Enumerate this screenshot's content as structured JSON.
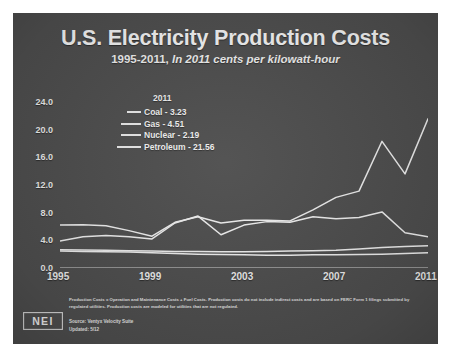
{
  "slide": {
    "background_color": "#4e4e4e",
    "title": "U.S. Electricity Production Costs",
    "subtitle_plain": "1995-2011,",
    "subtitle_italic": "In 2011 cents per kilowatt-hour"
  },
  "legend": {
    "header": "2011",
    "items": [
      {
        "label": "Coal - 3.23",
        "swatch_width": 14,
        "color": "#e8e8e8"
      },
      {
        "label": "Gas - 4.51",
        "swatch_width": 20,
        "color": "#e8e8e8"
      },
      {
        "label": "Nuclear - 2.19",
        "swatch_width": 20,
        "color": "#e8e8e8"
      },
      {
        "label": "Petroleum - 21.56",
        "swatch_width": 24,
        "color": "#e8e8e8"
      }
    ]
  },
  "footnote": "Production Costs = Operation and Maintenance Costs + Fuel Costs. Production costs do not include indirect costs and are based on FERC Form 1 filings submitted by regulated utilities. Production costs are modeled for utilities that are not regulated.",
  "source_line": "Source: Ventyx Velocity Suite",
  "updated_line": "Updated: 5/12",
  "logo": {
    "text": "NEI"
  },
  "chart_data": {
    "type": "line",
    "title": "U.S. Electricity Production Costs",
    "subtitle": "1995-2011, In 2011 cents per kilowatt-hour",
    "xlabel": "",
    "ylabel": "",
    "ylim": [
      0.0,
      24.0
    ],
    "xlim": [
      1995,
      2011
    ],
    "ytick_labels": [
      "0.0",
      "4.0",
      "8.0",
      "12.0",
      "16.0",
      "20.0",
      "24.0"
    ],
    "yticks": [
      0.0,
      4.0,
      8.0,
      12.0,
      16.0,
      20.0,
      24.0
    ],
    "xtick_labels": [
      "1995",
      "1999",
      "2003",
      "2007",
      "2011"
    ],
    "xticks": [
      1995,
      1999,
      2003,
      2007,
      2011
    ],
    "grid": false,
    "legend_position": "upper-left-inside",
    "line_color": "#ededed",
    "x": [
      1995,
      1996,
      1997,
      1998,
      1999,
      2000,
      2001,
      2002,
      2003,
      2004,
      2005,
      2006,
      2007,
      2008,
      2009,
      2010,
      2011
    ],
    "series": [
      {
        "name": "Petroleum",
        "final_value": 21.56,
        "values": [
          6.2,
          6.25,
          6.1,
          5.4,
          4.6,
          6.6,
          7.4,
          6.5,
          6.9,
          6.9,
          6.8,
          8.4,
          10.2,
          11.1,
          18.3,
          13.6,
          21.56
        ]
      },
      {
        "name": "Gas",
        "final_value": 4.51,
        "values": [
          3.9,
          4.5,
          4.7,
          4.5,
          4.2,
          6.5,
          7.5,
          4.8,
          6.2,
          6.7,
          6.6,
          7.4,
          7.1,
          7.3,
          8.1,
          5.1,
          4.51
        ]
      },
      {
        "name": "Coal",
        "final_value": 3.23,
        "values": [
          2.65,
          2.6,
          2.55,
          2.5,
          2.45,
          2.4,
          2.4,
          2.35,
          2.35,
          2.4,
          2.45,
          2.5,
          2.55,
          2.75,
          2.95,
          3.1,
          3.23
        ]
      },
      {
        "name": "Nuclear",
        "final_value": 2.19,
        "values": [
          2.45,
          2.4,
          2.35,
          2.3,
          2.2,
          2.1,
          2.0,
          1.95,
          1.9,
          1.85,
          1.85,
          1.9,
          1.9,
          1.95,
          2.0,
          2.1,
          2.19
        ]
      }
    ]
  }
}
